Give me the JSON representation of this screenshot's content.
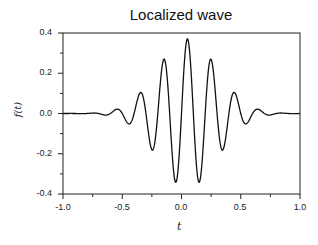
{
  "chart_data": {
    "type": "line",
    "title": "Localized wave",
    "xlabel": "t",
    "ylabel": "f(t)",
    "xlim": [
      -1.0,
      1.0
    ],
    "ylim": [
      -0.4,
      0.4
    ],
    "xticks": [
      "-1.0",
      "-0.5",
      "0.0",
      "0.5",
      "1.0"
    ],
    "yticks": [
      "0.4",
      "0.2",
      "0.0",
      "-0.2",
      "-0.4"
    ],
    "grid": false,
    "series": [
      {
        "name": "f(t)",
        "model": "0.37*exp(-(t-0.05)^2/(2*0.25^2))*cos(2*pi*5*(t-0.05))",
        "extrema": [
          {
            "t": -0.65,
            "f": -0.05
          },
          {
            "t": -0.55,
            "f": 0.13
          },
          {
            "t": -0.45,
            "f": -0.21
          },
          {
            "t": -0.35,
            "f": 0.27
          },
          {
            "t": -0.25,
            "f": -0.3
          },
          {
            "t": -0.15,
            "f": 0.35
          },
          {
            "t": -0.05,
            "f": -0.36
          },
          {
            "t": 0.05,
            "f": 0.37
          },
          {
            "t": 0.15,
            "f": -0.34
          },
          {
            "t": 0.25,
            "f": 0.33
          },
          {
            "t": 0.35,
            "f": -0.27
          },
          {
            "t": 0.45,
            "f": 0.21
          },
          {
            "t": 0.55,
            "f": -0.1
          },
          {
            "t": 0.65,
            "f": 0.05
          }
        ]
      }
    ]
  }
}
